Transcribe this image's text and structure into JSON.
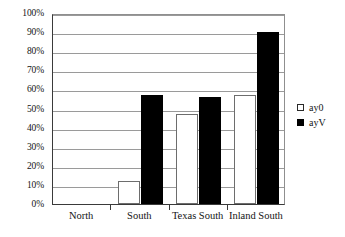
{
  "chart_data": {
    "type": "bar",
    "title": "",
    "subtitle": "",
    "xlabel": "",
    "ylabel": "",
    "ylim": [
      0,
      100
    ],
    "ytick_labels": [
      "100%",
      "90%",
      "80%",
      "70%",
      "60%",
      "50%",
      "40%",
      "30%",
      "20%",
      "10%",
      "0%"
    ],
    "ytick_values": [
      100,
      90,
      80,
      70,
      60,
      50,
      40,
      30,
      20,
      10,
      0
    ],
    "y_unit": "%",
    "grid": true,
    "legend_position": "right",
    "categories": [
      "North",
      "South",
      "Texas South",
      "Inland South"
    ],
    "series": [
      {
        "name": "ay0",
        "fill": "#ffffff",
        "values": [
          0,
          12,
          47,
          57
        ]
      },
      {
        "name": "ayV",
        "fill": "#000000",
        "values": [
          0,
          57,
          56,
          90
        ]
      }
    ]
  },
  "legend": {
    "items": [
      {
        "label": "ay0",
        "style": "hollow"
      },
      {
        "label": "ayV",
        "style": "filled"
      }
    ]
  },
  "colors": {
    "series_a": "#ffffff",
    "series_b": "#000000",
    "gridline": "#9a9a9a",
    "axis": "#3a3a3a",
    "text": "#141414",
    "background": "#ffffff"
  }
}
